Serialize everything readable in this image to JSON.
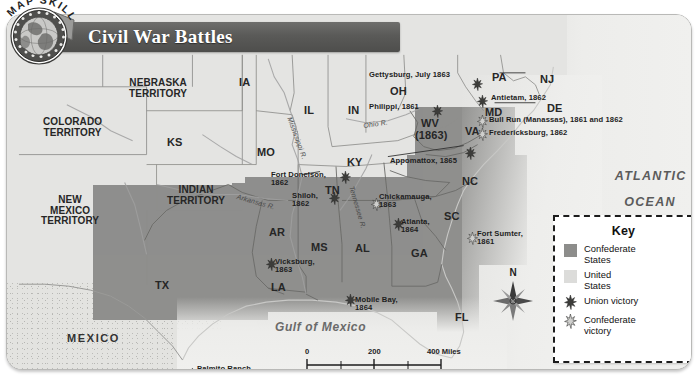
{
  "badge": {
    "text": "MAP SKILL",
    "icon": "globe-icon"
  },
  "title": {
    "text": "Civil War Battles"
  },
  "ocean_labels": {
    "atlantic_line1": "ATLANTIC",
    "atlantic_line2": "OCEAN",
    "gulf": "Gulf of Mexico"
  },
  "countries": [
    {
      "name": "MEXICO",
      "x": 60,
      "y": 318
    }
  ],
  "territories": [
    {
      "line1": "NEBRASKA",
      "line2": "TERRITORY",
      "x": 122,
      "y": 63
    },
    {
      "line1": "COLORADO",
      "line2": "TERRITORY",
      "x": 36,
      "y": 102
    },
    {
      "line1": "NEW",
      "line2": "MEXICO",
      "line3": "TERRITORY",
      "x": 34,
      "y": 180
    },
    {
      "line1": "INDIAN",
      "line2": "TERRITORY",
      "x": 160,
      "y": 170
    }
  ],
  "states": [
    {
      "abbr": "IA",
      "x": 232,
      "y": 62
    },
    {
      "abbr": "KS",
      "x": 160,
      "y": 122
    },
    {
      "abbr": "MO",
      "x": 250,
      "y": 132
    },
    {
      "abbr": "IL",
      "x": 297,
      "y": 90
    },
    {
      "abbr": "IN",
      "x": 341,
      "y": 90
    },
    {
      "abbr": "OH",
      "x": 383,
      "y": 71
    },
    {
      "abbr": "PA",
      "x": 485,
      "y": 57
    },
    {
      "abbr": "NJ",
      "x": 533,
      "y": 59
    },
    {
      "abbr": "MD",
      "x": 478,
      "y": 92
    },
    {
      "abbr": "DE",
      "x": 540,
      "y": 88
    },
    {
      "abbr": "WV",
      "x": 414,
      "y": 103
    },
    {
      "abbr": "(1863)",
      "x": 408,
      "y": 115
    },
    {
      "abbr": "VA",
      "x": 458,
      "y": 111
    },
    {
      "abbr": "KY",
      "x": 340,
      "y": 142
    },
    {
      "abbr": "TN",
      "x": 318,
      "y": 170
    },
    {
      "abbr": "NC",
      "x": 455,
      "y": 161
    },
    {
      "abbr": "SC",
      "x": 437,
      "y": 196
    },
    {
      "abbr": "GA",
      "x": 404,
      "y": 233
    },
    {
      "abbr": "AL",
      "x": 348,
      "y": 228
    },
    {
      "abbr": "MS",
      "x": 304,
      "y": 227
    },
    {
      "abbr": "AR",
      "x": 262,
      "y": 212
    },
    {
      "abbr": "LA",
      "x": 264,
      "y": 267
    },
    {
      "abbr": "TX",
      "x": 148,
      "y": 265
    },
    {
      "abbr": "FL",
      "x": 448,
      "y": 297
    }
  ],
  "rivers": [
    {
      "name": "Mississippi R.",
      "x": 286,
      "y": 101,
      "rot": 70
    },
    {
      "name": "Ohio R.",
      "x": 356,
      "y": 107,
      "rot": -8
    },
    {
      "name": "Arkansas R.",
      "x": 231,
      "y": 178,
      "rot": 16
    },
    {
      "name": "Tennessee R.",
      "x": 348,
      "y": 170,
      "rot": 74
    }
  ],
  "battles": [
    {
      "label": "Gettysburg, July 1863",
      "lx": 362,
      "ly": 56,
      "sx": 465,
      "sy": 62,
      "victor": "union"
    },
    {
      "label": "Antietam, 1862",
      "lx": 484,
      "ly": 79,
      "sx": 470,
      "sy": 79,
      "victor": "union"
    },
    {
      "label": "Philippi, 1861",
      "lx": 362,
      "ly": 88,
      "sx": 425,
      "sy": 89,
      "victor": "union"
    },
    {
      "label": "Bull Run (Manassas), 1861 and 1862",
      "lx": 482,
      "ly": 101,
      "sx": 470,
      "sy": 99,
      "victor": "confederate"
    },
    {
      "label": "Fredericksburg, 1862",
      "lx": 482,
      "ly": 114,
      "sx": 470,
      "sy": 112,
      "victor": "confederate"
    },
    {
      "label": "Appomattox, 1865",
      "lx": 383,
      "ly": 142,
      "sx": 458,
      "sy": 131,
      "victor": "union"
    },
    {
      "label": "Fort Donelson,\n1862",
      "lx": 264,
      "ly": 156,
      "sx": 333,
      "sy": 155,
      "victor": "union"
    },
    {
      "label": "Shiloh,\n1862",
      "lx": 285,
      "ly": 177,
      "sx": 322,
      "sy": 176,
      "victor": "union"
    },
    {
      "label": "Chickamauga,\n1863",
      "lx": 372,
      "ly": 178,
      "sx": 364,
      "sy": 182,
      "victor": "confederate"
    },
    {
      "label": "Atlanta,\n1864",
      "lx": 394,
      "ly": 203,
      "sx": 386,
      "sy": 202,
      "victor": "union"
    },
    {
      "label": "Fort Sumter,\n1861",
      "lx": 470,
      "ly": 215,
      "sx": 460,
      "sy": 216,
      "victor": "confederate"
    },
    {
      "label": "Vicksburg,\n1863",
      "lx": 268,
      "ly": 243,
      "sx": 259,
      "sy": 242,
      "victor": "union"
    },
    {
      "label": "Mobile Bay,\n1864",
      "lx": 348,
      "ly": 281,
      "sx": 338,
      "sy": 278,
      "victor": "union"
    },
    {
      "label": "Palmito Ranch,\n1865",
      "lx": 190,
      "ly": 350,
      "sx": 180,
      "sy": 352,
      "victor": "confederate"
    }
  ],
  "key": {
    "title": "Key",
    "items": [
      {
        "label": "Confederate\nStates",
        "type": "swatch-confederate"
      },
      {
        "label": "United\nStates",
        "type": "swatch-union"
      },
      {
        "label": "Union victory",
        "type": "star-union"
      },
      {
        "label": "Confederate\nvictory",
        "type": "star-confederate"
      }
    ]
  },
  "compass": {
    "north": "N"
  },
  "scale": {
    "miles": {
      "t0": "0",
      "t1": "200",
      "t2": "400 Miles"
    },
    "kilometers": {
      "t0": "0",
      "t1": "200",
      "t2": "400 Kilometers"
    }
  },
  "colors": {
    "confederate": "#8f8f8d",
    "union": "#e4e4e2",
    "banner": "#5a5a58",
    "ocean": "#ededeb"
  }
}
